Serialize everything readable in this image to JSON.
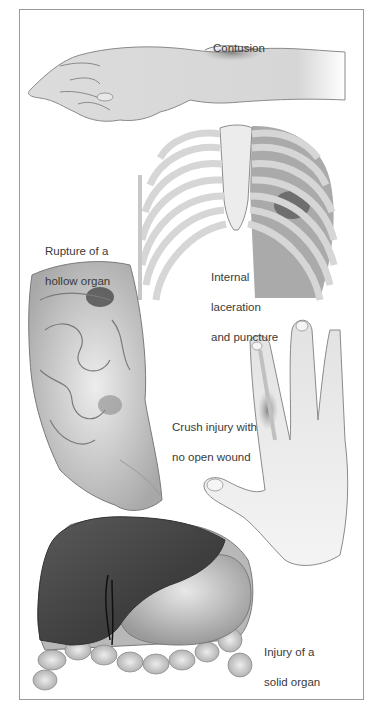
{
  "figure": {
    "type": "medical-illustration",
    "labels": {
      "contusion": "Contusion",
      "hollow_organ_line1": "Rupture of a",
      "hollow_organ_line2": "hollow organ",
      "internal_line1": "Internal",
      "internal_line2": "laceration",
      "internal_line3": "and puncture",
      "crush_line1": "Crush injury with",
      "crush_line2": "no open wound",
      "solid_organ_line1": "Injury of a",
      "solid_organ_line2": "solid organ"
    },
    "panels": [
      {
        "id": "arm",
        "label": "Contusion"
      },
      {
        "id": "ribcage",
        "label": "Internal laceration and puncture"
      },
      {
        "id": "intestines",
        "label": "Rupture of a hollow organ"
      },
      {
        "id": "hand",
        "label": "Crush injury with no open wound"
      },
      {
        "id": "liver",
        "label": "Injury of a solid organ"
      }
    ],
    "colors": {
      "frame": "#9a9a9a",
      "label_text": "#3a3a3a",
      "skin": "#e4e4e4",
      "outline": "#7a7a7a",
      "bone": "#efefef",
      "lung": "#8c8c8c",
      "liver": "#4a4a4a",
      "bruise": "#5a5a5a"
    }
  }
}
